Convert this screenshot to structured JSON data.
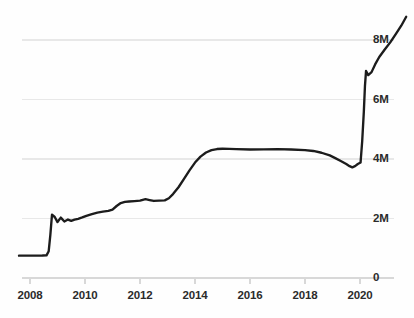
{
  "chart_data": {
    "type": "line",
    "title": "",
    "subtitle": "",
    "xlabel": "",
    "ylabel": "",
    "grid": true,
    "legend": null,
    "legend_position": "none",
    "line_color": "#1c1c1c",
    "gridline_color": "#e8e8e8",
    "background_color": "#fefefe",
    "xlim": [
      2007.6,
      2021.75
    ],
    "ylim": [
      0,
      8800000
    ],
    "x_tick_labels": [
      "2008",
      "2010",
      "2012",
      "2014",
      "2016",
      "2018",
      "2020"
    ],
    "x_tick_values": [
      2008,
      2010,
      2012,
      2014,
      2016,
      2018,
      2020
    ],
    "y_tick_labels": [
      "0",
      "2M",
      "4M",
      "6M",
      "8M"
    ],
    "y_tick_values": [
      0,
      2000000,
      4000000,
      6000000,
      8000000
    ],
    "series": [
      {
        "name": "value",
        "x": [
          2007.6,
          2007.9,
          2008.2,
          2008.45,
          2008.6,
          2008.68,
          2008.74,
          2008.8,
          2008.9,
          2009.0,
          2009.12,
          2009.25,
          2009.38,
          2009.5,
          2009.62,
          2009.75,
          2009.9,
          2010.05,
          2010.25,
          2010.45,
          2010.65,
          2010.85,
          2011.0,
          2011.15,
          2011.3,
          2011.45,
          2011.6,
          2011.8,
          2012.0,
          2012.2,
          2012.35,
          2012.5,
          2012.7,
          2012.9,
          2013.05,
          2013.2,
          2013.4,
          2013.6,
          2013.8,
          2014.0,
          2014.2,
          2014.4,
          2014.6,
          2014.8,
          2015.0,
          2015.25,
          2015.5,
          2016.0,
          2016.5,
          2017.0,
          2017.5,
          2018.0,
          2018.3,
          2018.6,
          2018.9,
          2019.1,
          2019.3,
          2019.5,
          2019.62,
          2019.72,
          2019.82,
          2019.92,
          2020.02,
          2020.08,
          2020.14,
          2020.18,
          2020.22,
          2020.3,
          2020.42,
          2020.55,
          2020.7,
          2020.9,
          2021.1,
          2021.3,
          2021.5,
          2021.68
        ],
        "y": [
          750000,
          750000,
          752000,
          755000,
          760000,
          900000,
          1450000,
          2130000,
          2050000,
          1880000,
          2030000,
          1900000,
          1965000,
          1920000,
          1960000,
          1990000,
          2035000,
          2090000,
          2150000,
          2200000,
          2230000,
          2255000,
          2300000,
          2420000,
          2520000,
          2560000,
          2570000,
          2585000,
          2600000,
          2650000,
          2620000,
          2590000,
          2600000,
          2610000,
          2680000,
          2820000,
          3050000,
          3330000,
          3620000,
          3880000,
          4080000,
          4220000,
          4300000,
          4335000,
          4345000,
          4340000,
          4330000,
          4320000,
          4325000,
          4330000,
          4320000,
          4300000,
          4270000,
          4210000,
          4120000,
          4030000,
          3930000,
          3830000,
          3760000,
          3720000,
          3760000,
          3830000,
          3880000,
          4600000,
          5600000,
          6450000,
          6960000,
          6820000,
          6920000,
          7180000,
          7430000,
          7680000,
          7920000,
          8200000,
          8480000,
          8780000
        ]
      }
    ],
    "annotations": []
  },
  "axes": {
    "y_labels": [
      {
        "text": "8M",
        "value": 8000000
      },
      {
        "text": "6M",
        "value": 6000000
      },
      {
        "text": "4M",
        "value": 4000000
      },
      {
        "text": "2M",
        "value": 2000000
      },
      {
        "text": "0",
        "value": 0
      }
    ],
    "x_labels": [
      {
        "text": "2008",
        "value": 2008
      },
      {
        "text": "2010",
        "value": 2010
      },
      {
        "text": "2012",
        "value": 2012
      },
      {
        "text": "2014",
        "value": 2014
      },
      {
        "text": "2016",
        "value": 2016
      },
      {
        "text": "2018",
        "value": 2018
      },
      {
        "text": "2020",
        "value": 2020
      }
    ]
  }
}
